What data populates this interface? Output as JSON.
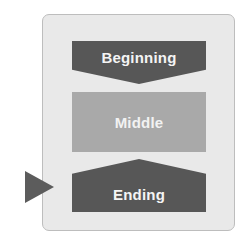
{
  "diagram": {
    "stages": [
      {
        "label": "Beginning",
        "shape": "down-arrow-banner",
        "color": "#575757"
      },
      {
        "label": "Middle",
        "shape": "rectangle",
        "color": "#a9a9a9"
      },
      {
        "label": "Ending",
        "shape": "up-peaked-banner",
        "color": "#575757"
      }
    ],
    "pointer": {
      "target": "Ending",
      "icon": "triangle-right-icon",
      "color": "#5c5c5c"
    },
    "colors": {
      "panel_bg": "#e9e9e9",
      "panel_border": "#bdbdbd",
      "text": "#f4f4f4"
    }
  }
}
